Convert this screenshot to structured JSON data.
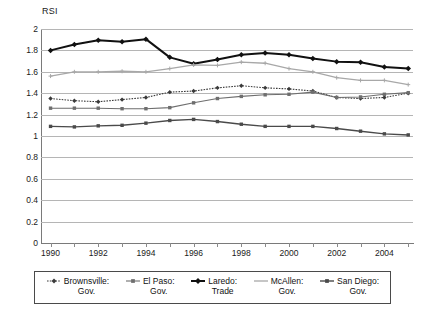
{
  "chart_data": {
    "type": "line",
    "title": "",
    "ylabel": "RSI",
    "xlabel": "",
    "ylim": [
      0,
      2
    ],
    "ytick_labels": [
      "2",
      "1.8",
      "1.6",
      "1.4",
      "1.2",
      "1",
      "0.8",
      "0.6",
      "0.4",
      "0.2",
      "0"
    ],
    "ytick_values": [
      2,
      1.8,
      1.6,
      1.4,
      1.2,
      1,
      0.8,
      0.6,
      0.4,
      0.2,
      0
    ],
    "grid": true,
    "legend_position": "bottom",
    "x": [
      1990,
      1991,
      1992,
      1993,
      1994,
      1995,
      1996,
      1997,
      1998,
      1999,
      2000,
      2001,
      2002,
      2003,
      2004,
      2005
    ],
    "xlim": [
      1989.6,
      2005.2
    ],
    "xtick_labels": [
      "1990",
      "1992",
      "1994",
      "1996",
      "1998",
      "2000",
      "2002",
      "2004"
    ],
    "xtick_values": [
      1990,
      1992,
      1994,
      1996,
      1998,
      2000,
      2002,
      2004
    ],
    "xminor_values": [
      1991,
      1993,
      1995,
      1997,
      1999,
      2001,
      2003,
      2005
    ],
    "series": [
      {
        "name": "Brownsville: Gov.",
        "label_line1": "Brownsville:",
        "label_line2": "Gov.",
        "color": "#3a3a3a",
        "marker": "diamond",
        "dash": "1.6,1.2",
        "width": 1.1,
        "values": [
          1.35,
          1.33,
          1.32,
          1.34,
          1.36,
          1.41,
          1.42,
          1.45,
          1.47,
          1.45,
          1.44,
          1.42,
          1.36,
          1.35,
          1.36,
          1.4
        ]
      },
      {
        "name": "El Paso: Gov.",
        "label_line1": "El Paso:",
        "label_line2": "Gov.",
        "color": "#6e6e6e",
        "marker": "square",
        "dash": "",
        "width": 1.1,
        "values": [
          1.26,
          1.26,
          1.26,
          1.255,
          1.255,
          1.265,
          1.31,
          1.35,
          1.37,
          1.385,
          1.39,
          1.41,
          1.36,
          1.365,
          1.39,
          1.405
        ]
      },
      {
        "name": "Laredo: Trade",
        "label_line1": "Laredo:",
        "label_line2": "Trade",
        "color": "#111111",
        "marker": "diamond",
        "dash": "",
        "width": 2.0,
        "values": [
          1.8,
          1.855,
          1.895,
          1.88,
          1.905,
          1.735,
          1.675,
          1.715,
          1.76,
          1.775,
          1.76,
          1.725,
          1.695,
          1.69,
          1.645,
          1.63
        ]
      },
      {
        "name": "McAllen: Gov.",
        "label_line1": "McAllen:",
        "label_line2": "Gov.",
        "color": "#a8a8a8",
        "marker": "plus",
        "dash": "",
        "width": 1.3,
        "values": [
          1.56,
          1.6,
          1.6,
          1.605,
          1.6,
          1.63,
          1.665,
          1.66,
          1.69,
          1.68,
          1.63,
          1.6,
          1.545,
          1.52,
          1.52,
          1.48
        ]
      },
      {
        "name": "San Diego: Gov.",
        "label_line1": "San Diego:",
        "label_line2": "Gov.",
        "color": "#4a4a4a",
        "marker": "square",
        "dash": "",
        "width": 1.4,
        "values": [
          1.09,
          1.085,
          1.095,
          1.1,
          1.12,
          1.145,
          1.155,
          1.135,
          1.11,
          1.09,
          1.09,
          1.09,
          1.07,
          1.045,
          1.02,
          1.01
        ]
      }
    ]
  },
  "axis": {
    "y_title": "RSI"
  },
  "footer": {
    "artifact_text": ""
  }
}
